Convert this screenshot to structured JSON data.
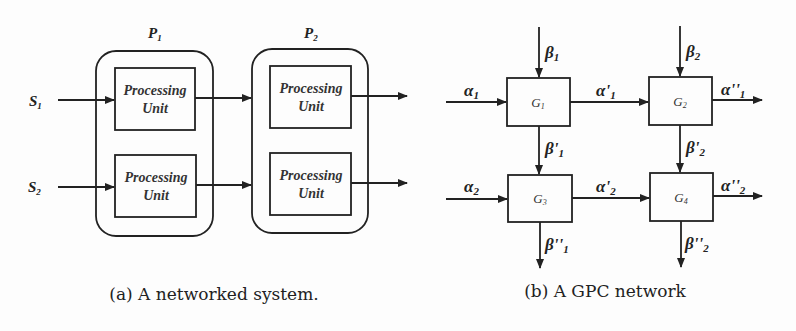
{
  "figure_a": {
    "caption": "(a) A networked system.",
    "processors": [
      {
        "label": "P",
        "sub": "1",
        "units": [
          "Processing Unit",
          "Processing Unit"
        ]
      },
      {
        "label": "P",
        "sub": "2",
        "units": [
          "Processing Unit",
          "Processing Unit"
        ]
      }
    ],
    "inputs": [
      {
        "label": "S",
        "sub": "1"
      },
      {
        "label": "S",
        "sub": "2"
      }
    ],
    "unit_line1": "Processing",
    "unit_line2": "Unit"
  },
  "figure_b": {
    "caption": "(b) A GPC network",
    "nodes": [
      {
        "label": "G",
        "sub": "1"
      },
      {
        "label": "G",
        "sub": "2"
      },
      {
        "label": "G",
        "sub": "3"
      },
      {
        "label": "G",
        "sub": "4"
      }
    ],
    "edges": {
      "alpha1": {
        "sym": "α",
        "prime": "",
        "sub": "1"
      },
      "alpha2": {
        "sym": "α",
        "prime": "",
        "sub": "2"
      },
      "alpha_p1": {
        "sym": "α",
        "prime": "'",
        "sub": "1"
      },
      "alpha_p2": {
        "sym": "α",
        "prime": "'",
        "sub": "2"
      },
      "alpha_pp1": {
        "sym": "α",
        "prime": "''",
        "sub": "1"
      },
      "alpha_pp2": {
        "sym": "α",
        "prime": "''",
        "sub": "2"
      },
      "beta1": {
        "sym": "β",
        "prime": "",
        "sub": "1"
      },
      "beta2": {
        "sym": "β",
        "prime": "",
        "sub": "2"
      },
      "beta_p1": {
        "sym": "β",
        "prime": "'",
        "sub": "1"
      },
      "beta_p2": {
        "sym": "β",
        "prime": "'",
        "sub": "2"
      },
      "beta_pp1": {
        "sym": "β",
        "prime": "''",
        "sub": "1"
      },
      "beta_pp2": {
        "sym": "β",
        "prime": "''",
        "sub": "2"
      }
    }
  }
}
